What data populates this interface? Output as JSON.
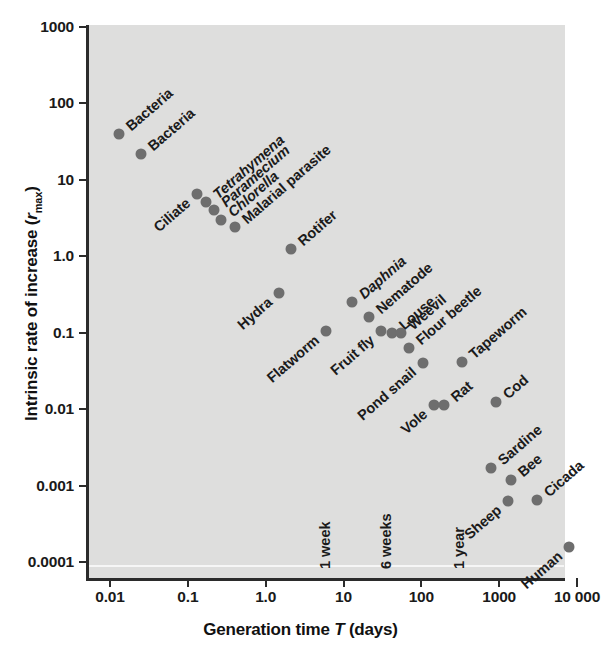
{
  "chart_data": {
    "type": "scatter",
    "title": "",
    "xlabel": "Generation time T (days)",
    "ylabel": "Intrinsic rate of increase (rmax)",
    "xscale": "log",
    "yscale": "log",
    "xlim": [
      0.005,
      20000
    ],
    "ylim": [
      0.0001,
      1000
    ],
    "grid": false,
    "legend": null,
    "xticks": [
      "0.01",
      "0.1",
      "1.0",
      "10",
      "100",
      "1000",
      "10 000"
    ],
    "yticks": [
      "1000",
      "100",
      "10",
      "1.0",
      "0.1",
      "0.01",
      "0.001",
      "0.0001"
    ],
    "point_color": "#6e6e6e",
    "plot_background": "#dededd",
    "annotations": [
      {
        "text": "1 week",
        "x": 7
      },
      {
        "text": "6 weeks",
        "x": 42
      },
      {
        "text": "1 year",
        "x": 365
      }
    ],
    "points": [
      {
        "label": "Bacteria",
        "x": 0.013,
        "y": 40,
        "italic": false,
        "anchor": "left"
      },
      {
        "label": "Bacteria",
        "x": 0.025,
        "y": 22,
        "italic": false,
        "anchor": "left"
      },
      {
        "label": "Ciliate",
        "x": 0.13,
        "y": 6.5,
        "italic": false,
        "anchor": "right"
      },
      {
        "label": "Tetrahymena",
        "x": 0.17,
        "y": 5.2,
        "italic": true,
        "anchor": "left"
      },
      {
        "label": "Paramecium",
        "x": 0.22,
        "y": 4.0,
        "italic": true,
        "anchor": "left"
      },
      {
        "label": "Chlorella",
        "x": 0.27,
        "y": 3.0,
        "italic": true,
        "anchor": "left"
      },
      {
        "label": "Malarial parasite",
        "x": 0.4,
        "y": 2.4,
        "italic": false,
        "anchor": "left"
      },
      {
        "label": "Rotifer",
        "x": 2.1,
        "y": 1.25,
        "italic": false,
        "anchor": "left"
      },
      {
        "label": "Hydra",
        "x": 1.5,
        "y": 0.33,
        "italic": false,
        "anchor": "right"
      },
      {
        "label": "Flatworm",
        "x": 6.0,
        "y": 0.105,
        "italic": false,
        "anchor": "right"
      },
      {
        "label": "Daphnia",
        "x": 13,
        "y": 0.25,
        "italic": true,
        "anchor": "left"
      },
      {
        "label": "Nematode",
        "x": 21,
        "y": 0.16,
        "italic": false,
        "anchor": "left"
      },
      {
        "label": "Fruit fly",
        "x": 30,
        "y": 0.105,
        "italic": false,
        "anchor": "right"
      },
      {
        "label": "Louse",
        "x": 42,
        "y": 0.1,
        "italic": false,
        "anchor": "left"
      },
      {
        "label": "Weevil",
        "x": 55,
        "y": 0.1,
        "italic": false,
        "anchor": "left"
      },
      {
        "label": "Flour beetle",
        "x": 70,
        "y": 0.063,
        "italic": false,
        "anchor": "left"
      },
      {
        "label": "Pond snail",
        "x": 105,
        "y": 0.04,
        "italic": false,
        "anchor": "right"
      },
      {
        "label": "Tapeworm",
        "x": 330,
        "y": 0.042,
        "italic": false,
        "anchor": "left"
      },
      {
        "label": "Vole",
        "x": 145,
        "y": 0.0115,
        "italic": false,
        "anchor": "right"
      },
      {
        "label": "Rat",
        "x": 195,
        "y": 0.0115,
        "italic": false,
        "anchor": "left"
      },
      {
        "label": "Cod",
        "x": 900,
        "y": 0.0125,
        "italic": false,
        "anchor": "left"
      },
      {
        "label": "Sardine",
        "x": 780,
        "y": 0.0017,
        "italic": false,
        "anchor": "left"
      },
      {
        "label": "Bee",
        "x": 1400,
        "y": 0.0012,
        "italic": false,
        "anchor": "left"
      },
      {
        "label": "Sheep",
        "x": 1300,
        "y": 0.00062,
        "italic": false,
        "anchor": "right"
      },
      {
        "label": "Cicada",
        "x": 3100,
        "y": 0.00065,
        "italic": false,
        "anchor": "left"
      },
      {
        "label": "Human",
        "x": 7800,
        "y": 0.000155,
        "italic": false,
        "anchor": "right"
      }
    ]
  }
}
